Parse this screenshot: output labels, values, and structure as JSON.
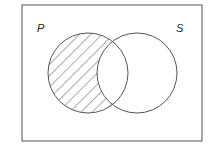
{
  "diagram": {
    "type": "venn",
    "universe_box": {
      "x": 22,
      "y": 5,
      "width": 180,
      "height": 136
    },
    "sets": [
      {
        "label": "P",
        "cx": 88,
        "cy": 73,
        "r": 40,
        "label_x": 37,
        "label_y": 32
      },
      {
        "label": "S",
        "cx": 137,
        "cy": 73,
        "r": 40,
        "label_x": 176,
        "label_y": 32
      }
    ],
    "shaded_region": "P minus S",
    "shading_style": "diagonal-hatch",
    "stroke_color": "#555555",
    "hatch_color": "#444444"
  }
}
